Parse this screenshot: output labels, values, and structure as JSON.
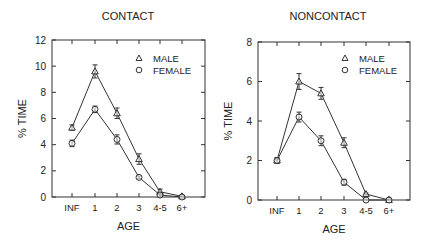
{
  "chart_data": [
    {
      "type": "line",
      "title": "CONTACT",
      "xlabel": "AGE",
      "ylabel": "% TIME",
      "categories": [
        "INF",
        "1",
        "2",
        "3",
        "4-5",
        "6+"
      ],
      "ylim": [
        0,
        12
      ],
      "yticks": [
        0,
        2,
        4,
        6,
        8,
        10,
        12
      ],
      "grid": false,
      "legend_position": "upper right",
      "series": [
        {
          "name": "MALE",
          "marker": "triangle",
          "values": [
            5.3,
            9.6,
            6.4,
            2.9,
            0.4,
            0.05
          ],
          "errors": [
            0.2,
            0.5,
            0.4,
            0.4,
            0.2,
            0.05
          ]
        },
        {
          "name": "FEMALE",
          "marker": "circle",
          "values": [
            4.1,
            6.7,
            4.4,
            1.5,
            0.15,
            0.0
          ],
          "errors": [
            0.25,
            0.25,
            0.35,
            0.1,
            0.1,
            0.05
          ]
        }
      ]
    },
    {
      "type": "line",
      "title": "NONCONTACT",
      "xlabel": "AGE",
      "ylabel": "% TIME",
      "categories": [
        "INF",
        "1",
        "2",
        "3",
        "4-5",
        "6+"
      ],
      "ylim": [
        0,
        8
      ],
      "yticks": [
        0,
        2,
        4,
        6,
        8
      ],
      "grid": false,
      "legend_position": "upper right",
      "series": [
        {
          "name": "MALE",
          "marker": "triangle",
          "values": [
            2.0,
            6.0,
            5.4,
            2.9,
            0.3,
            0.0
          ],
          "errors": [
            0.1,
            0.4,
            0.3,
            0.25,
            0.05,
            0.03
          ]
        },
        {
          "name": "FEMALE",
          "marker": "circle",
          "values": [
            2.0,
            4.2,
            3.0,
            0.9,
            0.0,
            0.0
          ],
          "errors": [
            0.15,
            0.25,
            0.25,
            0.15,
            0.03,
            0.03
          ]
        }
      ]
    }
  ],
  "layout": [
    {
      "x0": 52,
      "x1": 205,
      "y0": 197,
      "y1": 40,
      "xpos": [
        72,
        95,
        117,
        139,
        160,
        182
      ],
      "title_x": 128,
      "legend_x": 139,
      "legend_y": 62
    },
    {
      "x0": 258,
      "x1": 410,
      "y0": 200,
      "y1": 42,
      "xpos": [
        277,
        299,
        321,
        344,
        366,
        389
      ],
      "title_x": 328,
      "legend_x": 345,
      "legend_y": 62
    }
  ],
  "colors": {
    "line": "#333333",
    "text": "#222222"
  }
}
